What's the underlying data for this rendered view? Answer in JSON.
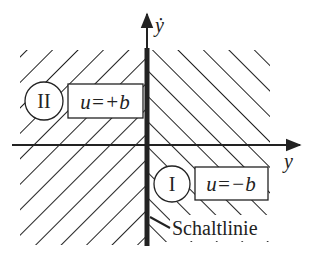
{
  "diagram": {
    "type": "phase-plane",
    "axes": {
      "x_label": "y",
      "y_label": "ẏ"
    },
    "regions": [
      {
        "id": "II",
        "numeral": "II",
        "control_law": "u=+b",
        "side": "left",
        "hatch": "forward-slash"
      },
      {
        "id": "I",
        "numeral": "I",
        "control_law": "u=−b",
        "side": "right",
        "hatch": "back-slash"
      }
    ],
    "switching_line": {
      "label": "Schaltlinie"
    },
    "colors": {
      "ink": "#222222",
      "background": "#ffffff"
    }
  }
}
